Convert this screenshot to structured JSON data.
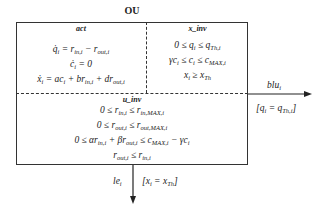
{
  "diagram": {
    "title": "OU",
    "sections": {
      "act": {
        "title": "act",
        "equations": [
          "q̇ᵢ = r_in,i − r_out,i",
          "ċᵢ = 0",
          "ẋᵢ = acᵢ + br_in,i + dr_out,i"
        ]
      },
      "x_inv": {
        "title": "x_inv",
        "equations": [
          "0 ≤ qᵢ ≤ q_Th,i",
          "γcᵢ ≤ cᵢ ≤ c_MAX,i",
          "xᵢ ≥ x_Th"
        ]
      },
      "u_inv": {
        "title": "u_inv",
        "equations": [
          "0 ≤ r_in,i ≤ r_in,MAX,i",
          "0 ≤ r_out,i ≤ r_out,MAX,i",
          "0 ≤ αr_in,i + βr_out,i ≤ c_MAX,i − γcᵢ",
          "r_out,i ≤ r_in,i"
        ]
      }
    },
    "transitions": [
      {
        "label": "bluᵢ",
        "guard": "[qᵢ = q_Th,i]",
        "direction": "right"
      },
      {
        "label": "leᵢ",
        "guard": "[xᵢ = x_Th]",
        "direction": "down"
      }
    ],
    "colors": {
      "line": "#333333",
      "text": "#222222",
      "background": "#ffffff"
    }
  }
}
